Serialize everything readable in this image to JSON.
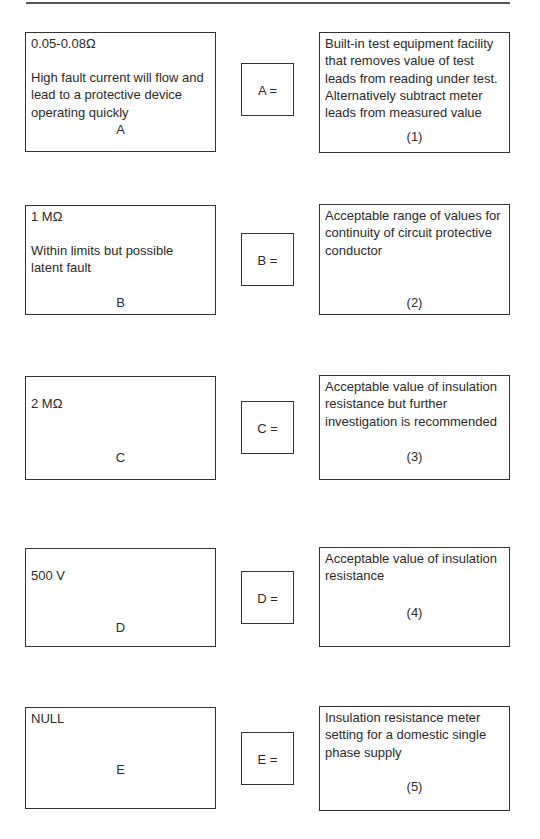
{
  "rows": [
    {
      "key": "A",
      "left": {
        "value": "0.05-0.08Ω",
        "description_lines": [
          "High fault current will flow and",
          "lead to a protective device",
          "operating quickly"
        ],
        "label": "A"
      },
      "middle": {
        "label": "A ="
      },
      "right": {
        "description_lines": [
          "Built-in test equipment facility",
          "that removes value of test",
          "leads from reading under test.",
          "Alternatively subtract meter",
          "leads from measured value"
        ],
        "number": "(1)"
      }
    },
    {
      "key": "B",
      "left": {
        "value": "1 MΩ",
        "description_lines": [
          "Within limits but possible",
          "latent fault"
        ],
        "label": "B"
      },
      "middle": {
        "label": "B ="
      },
      "right": {
        "description_lines": [
          "Acceptable range of values for",
          "continuity of circuit protective",
          "conductor"
        ],
        "number": "(2)"
      }
    },
    {
      "key": "C",
      "left": {
        "value": "2 MΩ",
        "description_lines": [],
        "label": "C"
      },
      "middle": {
        "label": "C ="
      },
      "right": {
        "description_lines": [
          "Acceptable value of insulation",
          "resistance but further",
          "investigation is recommended"
        ],
        "number": "(3)"
      }
    },
    {
      "key": "D",
      "left": {
        "value": "500 V",
        "description_lines": [],
        "label": "D"
      },
      "middle": {
        "label": "D ="
      },
      "right": {
        "description_lines": [
          "Acceptable value of insulation",
          "resistance"
        ],
        "number": "(4)"
      }
    },
    {
      "key": "E",
      "left": {
        "value": "NULL",
        "description_lines": [],
        "label": "E"
      },
      "middle": {
        "label": "E ="
      },
      "right": {
        "description_lines": [
          "Insulation resistance meter",
          "setting for a domestic single",
          "phase supply"
        ],
        "number": "(5)"
      }
    }
  ],
  "colors": {
    "border": "#333333",
    "text": "#2a2a2a",
    "top_rule": "#555555",
    "background": "#ffffff"
  }
}
